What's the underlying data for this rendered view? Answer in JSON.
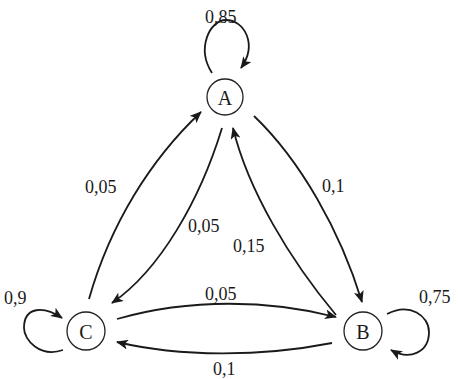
{
  "diagram": {
    "type": "markov-chain-state-diagram",
    "nodes": [
      {
        "id": "A",
        "label": "A"
      },
      {
        "id": "B",
        "label": "B"
      },
      {
        "id": "C",
        "label": "C"
      }
    ],
    "edges": [
      {
        "from": "A",
        "to": "A",
        "label": "0,85"
      },
      {
        "from": "A",
        "to": "B",
        "label": "0,1"
      },
      {
        "from": "A",
        "to": "C",
        "label": "0,05"
      },
      {
        "from": "B",
        "to": "B",
        "label": "0,75"
      },
      {
        "from": "B",
        "to": "A",
        "label": "0,15"
      },
      {
        "from": "B",
        "to": "C",
        "label": "0,1"
      },
      {
        "from": "C",
        "to": "C",
        "label": "0,9"
      },
      {
        "from": "C",
        "to": "A",
        "label": "0,05"
      },
      {
        "from": "C",
        "to": "B",
        "label": "0,05"
      }
    ],
    "colors": {
      "stroke": "#1a1a1a",
      "background": "#ffffff"
    }
  }
}
